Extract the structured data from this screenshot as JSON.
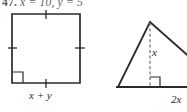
{
  "exercise": {
    "number": "47.",
    "given": "x = 10, y = 5"
  },
  "figures": {
    "square": {
      "base_label": "x + y",
      "right_angle_marker": "right-angle-marker",
      "tick_marks": [
        "tick-top",
        "tick-left",
        "tick-right",
        "tick-bottom"
      ],
      "stroke_color": "#2b2b2b"
    },
    "triangle": {
      "height_label": "x",
      "base_label": "2x",
      "altitude_style": "dashed",
      "right_angle_marker": "right-angle-marker",
      "stroke_color": "#2b2b2b"
    }
  }
}
